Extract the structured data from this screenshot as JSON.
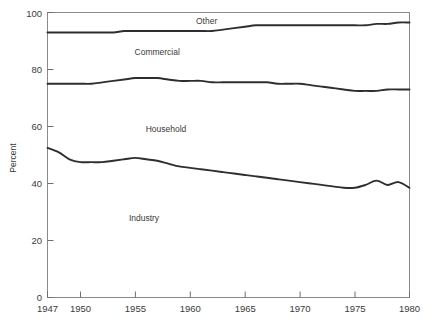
{
  "figure": {
    "title": "",
    "y_axis_title": "Percent"
  },
  "axes": {
    "y_ticks": [
      "0",
      "20",
      "40",
      "60",
      "80",
      "100"
    ],
    "x_ticks": [
      "1947",
      "1950",
      "1955",
      "1960",
      "1965",
      "1970",
      "1975",
      "1980"
    ]
  },
  "labels": {
    "other": "Other",
    "commercial": "Commercial",
    "household": "Household",
    "industry": "Industry"
  },
  "chart_data": {
    "type": "area",
    "title": "",
    "subtitle": "",
    "xlabel": "",
    "ylabel": "Percent",
    "xlim": [
      1947,
      1980
    ],
    "ylim": [
      0,
      100
    ],
    "grid": false,
    "legend": "inline-labels",
    "stacked": true,
    "note": "Cumulative stacked boundary lines: Industry is lowest band, then Household, then Commercial, then Other to 100.",
    "x": [
      1947,
      1948,
      1949,
      1950,
      1951,
      1952,
      1953,
      1954,
      1955,
      1956,
      1957,
      1958,
      1959,
      1960,
      1961,
      1962,
      1963,
      1964,
      1965,
      1966,
      1967,
      1968,
      1969,
      1970,
      1971,
      1972,
      1973,
      1974,
      1975,
      1976,
      1977,
      1978,
      1979,
      1980
    ],
    "boundaries": [
      {
        "name": "Industry (cumulative top)",
        "values": [
          52.5,
          51.0,
          48.5,
          47.5,
          47.5,
          47.5,
          48.0,
          48.5,
          49.0,
          48.5,
          48.0,
          47.0,
          46.0,
          45.5,
          45.0,
          44.5,
          44.0,
          43.5,
          43.0,
          42.5,
          42.0,
          41.5,
          41.0,
          40.5,
          40.0,
          39.5,
          39.0,
          38.5,
          38.5,
          39.5,
          41.0,
          39.5,
          40.5,
          38.5
        ]
      },
      {
        "name": "Household (cumulative top)",
        "values": [
          75.0,
          75.0,
          75.0,
          75.0,
          75.0,
          75.5,
          76.0,
          76.5,
          77.0,
          77.0,
          77.0,
          76.5,
          76.0,
          76.0,
          76.0,
          75.5,
          75.5,
          75.5,
          75.5,
          75.5,
          75.5,
          75.0,
          75.0,
          75.0,
          74.5,
          74.0,
          73.5,
          73.0,
          72.5,
          72.5,
          72.5,
          73.0,
          73.0,
          73.0
        ]
      },
      {
        "name": "Commercial (cumulative top)",
        "values": [
          93.0,
          93.0,
          93.0,
          93.0,
          93.0,
          93.0,
          93.0,
          93.5,
          93.5,
          93.5,
          93.5,
          93.5,
          93.5,
          93.5,
          93.5,
          93.5,
          94.0,
          94.5,
          95.0,
          95.5,
          95.5,
          95.5,
          95.5,
          95.5,
          95.5,
          95.5,
          95.5,
          95.5,
          95.5,
          95.5,
          96.0,
          96.0,
          96.5,
          96.5
        ]
      },
      {
        "name": "Other (cumulative top)",
        "values": [
          100,
          100,
          100,
          100,
          100,
          100,
          100,
          100,
          100,
          100,
          100,
          100,
          100,
          100,
          100,
          100,
          100,
          100,
          100,
          100,
          100,
          100,
          100,
          100,
          100,
          100,
          100,
          100,
          100,
          100,
          100,
          100,
          100,
          100
        ]
      }
    ],
    "series": [
      {
        "name": "Industry",
        "label_position": {
          "x": 1955.8,
          "y": 27
        }
      },
      {
        "name": "Household",
        "label_position": {
          "x": 1957.8,
          "y": 58
        }
      },
      {
        "name": "Commercial",
        "label_position": {
          "x": 1957.0,
          "y": 85
        }
      },
      {
        "name": "Other",
        "label_position": {
          "x": 1961.5,
          "y": 96
        }
      }
    ]
  }
}
